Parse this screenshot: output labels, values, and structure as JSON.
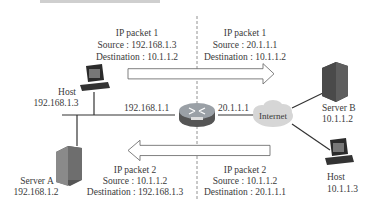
{
  "header": {
    "caption_cut_off": true
  },
  "packet1_left": {
    "title": "IP packet 1",
    "source": "Source : 192.168.1.3",
    "destination": "Destination : 10.1.1.2"
  },
  "packet1_right": {
    "title": "IP packet 1",
    "source": "Source : 20.1.1.1",
    "destination": "Destination : 10.1.1.2"
  },
  "packet2_left": {
    "title": "IP packet 2",
    "source": "Source : 10.1.1.2",
    "destination": "Destination : 192.168.1.3"
  },
  "packet2_right": {
    "title": "IP packet 2",
    "source": "Source : 10.1.1.2",
    "destination": "Destination : 20.1.1.1"
  },
  "nodes": {
    "host_a": {
      "name": "Host",
      "ip": "192.168.1.3"
    },
    "server_a": {
      "name": "Server A",
      "ip": "192.168.1.2"
    },
    "router": {
      "inside_ip": "192.168.1.1",
      "outside_ip": "20.1.1.1"
    },
    "internet": {
      "label": "Internet"
    },
    "server_b": {
      "name": "Server B",
      "ip": "10.1.1.2"
    },
    "host_b": {
      "name": "Host",
      "ip": "10.1.1.3"
    }
  },
  "colors": {
    "line": "#333333",
    "arrow_stroke": "#555555",
    "cloud": "#d9d9d9",
    "router": "#8a8f96",
    "server": "#5a5a5a"
  }
}
